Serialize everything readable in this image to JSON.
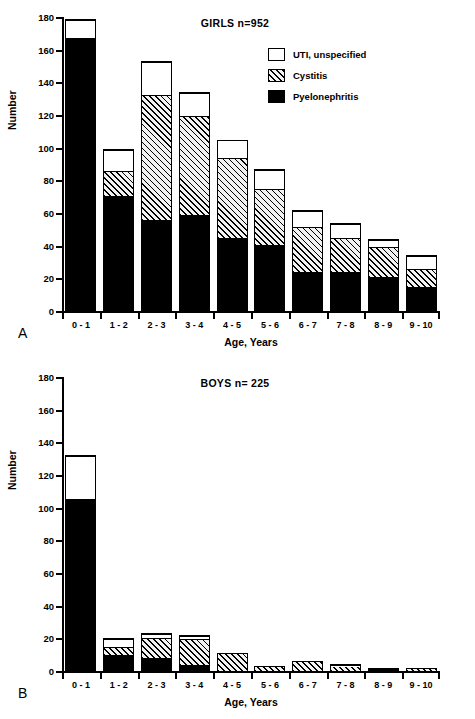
{
  "figure": {
    "panels": [
      {
        "letter": "A",
        "title": "GIRLS  n=952",
        "xlabel": "Age, Years",
        "ylabel": "Number"
      },
      {
        "letter": "B",
        "title": "BOYS  n= 225",
        "xlabel": "Age, Years",
        "ylabel": "Number"
      }
    ],
    "legend": [
      {
        "label": "UTI, unspecified",
        "swatch": "white-square-icon"
      },
      {
        "label": "Cystitis",
        "swatch": "hatched-square-icon"
      },
      {
        "label": "Pyelonephritis",
        "swatch": "black-square-icon"
      }
    ]
  },
  "chart_data": [
    {
      "type": "bar",
      "stacked": true,
      "title": "GIRLS  n=952",
      "panel": "A",
      "xlabel": "Age, Years",
      "ylabel": "Number",
      "ylim": [
        0,
        180
      ],
      "yticks": [
        0,
        20,
        40,
        60,
        80,
        100,
        120,
        140,
        160,
        180
      ],
      "grid": false,
      "legend_position": "upper-right",
      "categories": [
        "0 - 1",
        "1 - 2",
        "2 - 3",
        "3 - 4",
        "4 - 5",
        "5 - 6",
        "6 - 7",
        "7 - 8",
        "8 - 9",
        "9 - 10"
      ],
      "series": [
        {
          "name": "Pyelonephritis",
          "values": [
            168,
            71,
            56,
            59,
            45,
            41,
            24,
            24,
            21,
            15
          ]
        },
        {
          "name": "Cystitis",
          "values": [
            0,
            15,
            77,
            61,
            49,
            34,
            28,
            21,
            19,
            11
          ]
        },
        {
          "name": "UTI, unspecified",
          "values": [
            11,
            13,
            20,
            14,
            11,
            12,
            10,
            9,
            4,
            8
          ]
        }
      ],
      "totals": [
        179,
        99,
        153,
        134,
        105,
        87,
        62,
        54,
        44,
        34
      ]
    },
    {
      "type": "bar",
      "stacked": true,
      "title": "BOYS  n= 225",
      "panel": "B",
      "xlabel": "Age, Years",
      "ylabel": "Number",
      "ylim": [
        0,
        180
      ],
      "yticks": [
        0,
        20,
        40,
        60,
        80,
        100,
        120,
        140,
        160,
        180
      ],
      "grid": false,
      "legend_position": "upper-right",
      "categories": [
        "0 - 1",
        "1 - 2",
        "2 - 3",
        "3 - 4",
        "4 - 5",
        "5 - 6",
        "6 - 7",
        "7 - 8",
        "8 - 9",
        "9 - 10"
      ],
      "series": [
        {
          "name": "Pyelonephritis",
          "values": [
            106,
            10,
            8,
            4,
            0,
            0,
            0,
            0,
            2,
            0
          ]
        },
        {
          "name": "Cystitis",
          "values": [
            0,
            5,
            13,
            16,
            11,
            3,
            6,
            3,
            0,
            2
          ]
        },
        {
          "name": "UTI, unspecified",
          "values": [
            26,
            5,
            2,
            2,
            0,
            0,
            0,
            1,
            0,
            0
          ]
        }
      ],
      "totals": [
        132,
        20,
        23,
        22,
        11,
        3,
        6,
        4,
        2,
        2
      ]
    }
  ]
}
